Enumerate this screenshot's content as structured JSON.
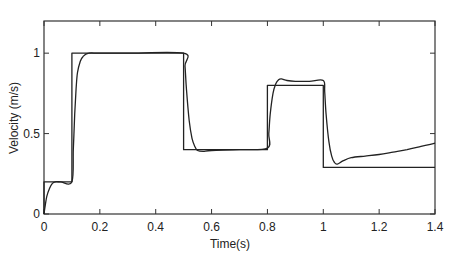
{
  "chart_data": {
    "type": "line",
    "title": "",
    "xlabel": "Time(s)",
    "ylabel": "Velocity (m/s)",
    "xlim": [
      0,
      1.4
    ],
    "ylim": [
      0,
      1.2
    ],
    "grid": false,
    "legend": null,
    "x_ticks": [
      0,
      0.2,
      0.4,
      0.6,
      0.8,
      1,
      1.2,
      1.4
    ],
    "x_tick_labels": [
      "0",
      "0.2",
      "0.4",
      "0.6",
      "0.8",
      "1",
      "1.2",
      "1.4"
    ],
    "y_ticks": [
      0,
      0.5,
      1
    ],
    "y_tick_labels": [
      "0",
      "0.5",
      "1"
    ],
    "series": [
      {
        "name": "reference",
        "style": "step",
        "color": "#222222",
        "x": [
          0,
          0,
          0.1,
          0.1,
          0.5,
          0.5,
          0.8,
          0.8,
          1.0,
          1.0,
          1.4
        ],
        "y": [
          0,
          0.2,
          0.2,
          1.0,
          1.0,
          0.4,
          0.4,
          0.8,
          0.8,
          0.29,
          0.29
        ]
      },
      {
        "name": "response",
        "style": "smooth",
        "color": "#222222",
        "x": [
          0,
          0.005,
          0.01,
          0.02,
          0.03,
          0.04,
          0.06,
          0.1,
          0.105,
          0.11,
          0.115,
          0.12,
          0.13,
          0.14,
          0.16,
          0.2,
          0.3,
          0.5,
          0.505,
          0.51,
          0.52,
          0.53,
          0.54,
          0.55,
          0.57,
          0.6,
          0.7,
          0.8,
          0.805,
          0.81,
          0.82,
          0.83,
          0.84,
          0.85,
          0.87,
          0.9,
          0.95,
          1.0,
          1.005,
          1.01,
          1.02,
          1.03,
          1.04,
          1.05,
          1.07,
          1.1,
          1.15,
          1.2,
          1.25,
          1.3,
          1.35,
          1.4
        ],
        "y": [
          0,
          0.06,
          0.11,
          0.16,
          0.19,
          0.2,
          0.2,
          0.2,
          0.4,
          0.62,
          0.78,
          0.88,
          0.95,
          0.98,
          1.0,
          1.0,
          1.0,
          1.0,
          0.92,
          0.78,
          0.58,
          0.47,
          0.42,
          0.395,
          0.39,
          0.395,
          0.4,
          0.41,
          0.5,
          0.62,
          0.75,
          0.81,
          0.835,
          0.84,
          0.83,
          0.825,
          0.825,
          0.83,
          0.76,
          0.62,
          0.45,
          0.36,
          0.32,
          0.31,
          0.33,
          0.35,
          0.36,
          0.37,
          0.385,
          0.4,
          0.42,
          0.44
        ]
      }
    ]
  }
}
